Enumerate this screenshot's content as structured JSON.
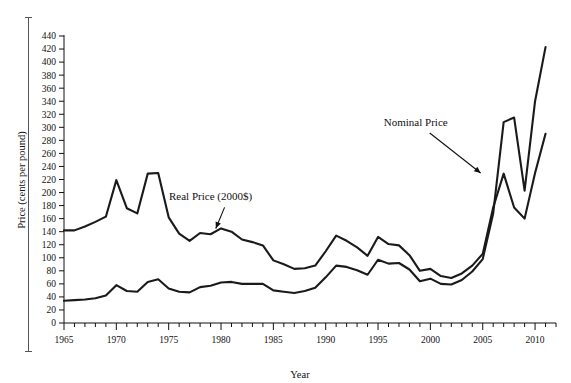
{
  "chart_data": {
    "type": "line",
    "title": "",
    "xlabel": "Year",
    "ylabel": "Price (cents per pound)",
    "xlim": [
      1965,
      2012
    ],
    "ylim": [
      0,
      440
    ],
    "ytick_step": 20,
    "xtick_step": 5,
    "xminor_step": 1,
    "grid": false,
    "legend": "annotations",
    "xticks": [
      1965,
      1970,
      1975,
      1980,
      1985,
      1990,
      1995,
      2000,
      2005,
      2010
    ],
    "yticks": [
      0,
      20,
      40,
      60,
      80,
      100,
      120,
      140,
      160,
      180,
      200,
      220,
      240,
      260,
      280,
      300,
      320,
      340,
      360,
      380,
      400,
      420,
      440
    ],
    "x": [
      1965,
      1966,
      1967,
      1968,
      1969,
      1970,
      1971,
      1972,
      1973,
      1974,
      1975,
      1976,
      1977,
      1978,
      1979,
      1980,
      1981,
      1982,
      1983,
      1984,
      1985,
      1986,
      1987,
      1988,
      1989,
      1990,
      1991,
      1992,
      1993,
      1994,
      1995,
      1996,
      1997,
      1998,
      1999,
      2000,
      2001,
      2002,
      2003,
      2004,
      2005,
      2006,
      2007,
      2008,
      2009,
      2010,
      2011
    ],
    "series": [
      {
        "name": "Real Price (2000$)",
        "color": "#1a1a1a",
        "values": [
          142,
          142,
          148,
          155,
          163,
          219,
          176,
          168,
          229,
          230,
          162,
          137,
          126,
          138,
          136,
          145,
          140,
          128,
          124,
          119,
          96,
          90,
          83,
          84,
          88,
          110,
          134,
          126,
          116,
          103,
          132,
          121,
          119,
          104,
          80,
          83,
          72,
          69,
          76,
          88,
          106,
          177,
          229,
          177,
          160,
          230,
          290
        ],
        "annotation": {
          "text": "Real Price (2000$)",
          "text_x": 1979.0,
          "text_y": 188,
          "arrow_to_x": 1979.5,
          "arrow_to_y": 145
        }
      },
      {
        "name": "Nominal Price",
        "color": "#1a1a1a",
        "values": [
          34,
          35,
          36,
          38,
          42,
          58,
          49,
          48,
          63,
          67,
          53,
          48,
          47,
          55,
          57,
          62,
          63,
          60,
          60,
          60,
          50,
          48,
          46,
          49,
          54,
          70,
          88,
          86,
          81,
          74,
          97,
          91,
          92,
          82,
          64,
          68,
          60,
          59,
          66,
          79,
          98,
          168,
          308,
          315,
          203,
          340,
          423
        ],
        "annotation": {
          "text": "Nominal Price",
          "text_x": 1998.6,
          "text_y": 302,
          "arrow_to_x": 2004.8,
          "arrow_to_y": 230
        }
      }
    ]
  }
}
